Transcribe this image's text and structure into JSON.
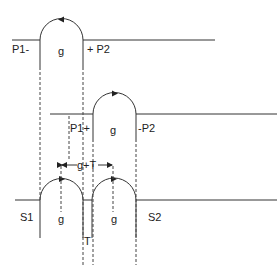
{
  "diagram": {
    "rows": [
      {
        "id": "top",
        "left_label": "P1-",
        "gap_label": "g",
        "right_label": "+ P2",
        "arrow_direction": "left"
      },
      {
        "id": "middle",
        "left_label": "P1+",
        "gap_label": "g",
        "right_label": "-P2",
        "arrow_direction": "right"
      },
      {
        "id": "bottom",
        "left_label": "S1",
        "gap1_label": "g",
        "gap2_label": "g",
        "right_label": "S2",
        "separator_label": "T"
      }
    ],
    "dimension_label": "g+T",
    "colors": {
      "stroke": "#333333",
      "background": "#ffffff"
    }
  }
}
